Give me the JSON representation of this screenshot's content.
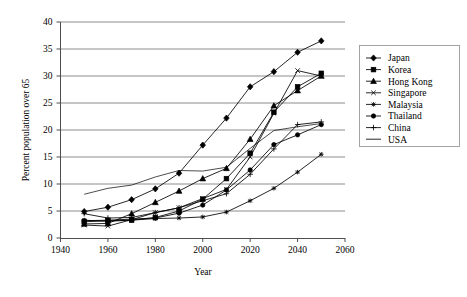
{
  "chart_data": {
    "type": "line",
    "title": "",
    "xlabel": "Year",
    "ylabel": "Percent population over 65",
    "xlim": [
      1940,
      2060
    ],
    "ylim": [
      0,
      40
    ],
    "xticks": [
      1940,
      1960,
      1980,
      2000,
      2020,
      2040,
      2060
    ],
    "yticks": [
      0,
      5,
      10,
      15,
      20,
      25,
      30,
      35,
      40
    ],
    "grid": "horizontal",
    "legend_position": "right",
    "x": [
      1950,
      1960,
      1970,
      1980,
      1990,
      2000,
      2010,
      2020,
      2030,
      2040,
      2050
    ],
    "series": [
      {
        "name": "Japan",
        "marker": "diamond",
        "values": [
          4.9,
          5.7,
          7.1,
          9.1,
          12.0,
          17.2,
          22.2,
          28.0,
          30.8,
          34.4,
          36.5
        ]
      },
      {
        "name": "Korea",
        "marker": "square",
        "values": [
          3.0,
          3.2,
          3.3,
          3.8,
          5.0,
          7.2,
          11.0,
          15.7,
          23.3,
          28.0,
          30.5
        ]
      },
      {
        "name": "Hong Kong",
        "marker": "triangle",
        "values": [
          2.6,
          2.7,
          4.5,
          6.6,
          8.7,
          11.0,
          12.9,
          18.3,
          24.5,
          27.3,
          30.0
        ]
      },
      {
        "name": "Singapore",
        "marker": "cross-x",
        "values": [
          2.4,
          2.2,
          3.4,
          4.7,
          5.6,
          7.3,
          9.0,
          15.0,
          23.1,
          31.0,
          30.0
        ]
      },
      {
        "name": "Malaysia",
        "marker": "star",
        "values": [
          3.3,
          3.1,
          3.3,
          3.6,
          3.7,
          3.9,
          4.8,
          6.9,
          9.2,
          12.2,
          15.5
        ]
      },
      {
        "name": "Thailand",
        "marker": "circle",
        "values": [
          3.2,
          3.3,
          3.5,
          3.7,
          4.6,
          6.1,
          8.9,
          12.6,
          17.3,
          19.1,
          21.0
        ]
      },
      {
        "name": "China",
        "marker": "plus",
        "values": [
          4.5,
          3.7,
          3.8,
          4.7,
          5.6,
          6.9,
          8.2,
          11.8,
          16.5,
          21.0,
          21.5
        ]
      },
      {
        "name": "USA",
        "marker": "none",
        "values": [
          8.1,
          9.2,
          9.8,
          11.3,
          12.5,
          12.4,
          13.1,
          16.6,
          19.9,
          20.6,
          21.2
        ]
      }
    ]
  },
  "legend": {
    "entries": [
      {
        "label": "Japan"
      },
      {
        "label": "Korea"
      },
      {
        "label": "Hong Kong"
      },
      {
        "label": "Singapore"
      },
      {
        "label": "Malaysia"
      },
      {
        "label": "Thailand"
      },
      {
        "label": "China"
      },
      {
        "label": "USA"
      }
    ]
  },
  "axes": {
    "x_title": "Year",
    "y_title": "Percent population over 65",
    "x_tick_labels": [
      "1940",
      "1960",
      "1980",
      "2000",
      "2020",
      "2040",
      "2060"
    ],
    "y_tick_labels": [
      "0",
      "5",
      "10",
      "15",
      "20",
      "25",
      "30",
      "35",
      "40"
    ]
  },
  "colors": {
    "line": "#000000",
    "grid": "#808080",
    "axis": "#4d4d4d",
    "background": "#ffffff"
  }
}
